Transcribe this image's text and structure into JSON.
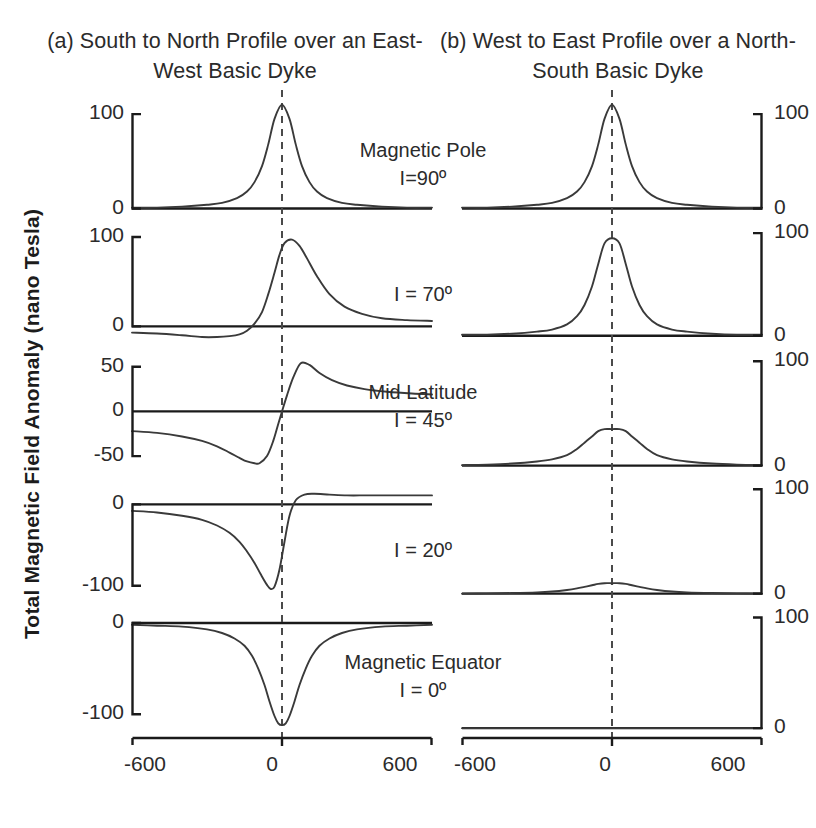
{
  "figure": {
    "ylabel": "Total Magnetic Field Anomaly (nano Tesla)",
    "columns": [
      {
        "id": "a",
        "title": "(a) South to North Profile over an East-West  Basic Dyke"
      },
      {
        "id": "b",
        "title": "(b) West to East Profile over a North-South Basic Dyke"
      }
    ],
    "annotations": [
      {
        "line1": "Magnetic Pole",
        "line2": "I=90º"
      },
      {
        "line1": "",
        "line2": "I = 70º"
      },
      {
        "line1": "Mid Latitude",
        "line2": "I = 45º"
      },
      {
        "line1": "",
        "line2": "I = 20º"
      },
      {
        "line1": "Magnetic Equator",
        "line2": "I = 0º"
      }
    ],
    "xaxis": {
      "ticks": [
        "-600",
        "0",
        "600"
      ],
      "min": -600,
      "max": 600
    },
    "axis_color": "#1a1a1a",
    "curve_color": "#3a3a3a",
    "dash_color": "#4a4a4a"
  },
  "chart_data": {
    "type": "line",
    "xlabel": "",
    "ylabel": "Total Magnetic Field Anomaly (nano Tesla)",
    "xlim": [
      -600,
      600
    ],
    "xticks": [
      -600,
      0,
      600
    ],
    "grid": false,
    "legend": null,
    "panels": [
      {
        "row": 1,
        "inclination_deg": 90,
        "label": "Magnetic Pole I=90º",
        "left": {
          "name": "South to North Profile over an East-West Basic Dyke",
          "yticks": [
            0,
            100
          ],
          "ylim": [
            -10,
            115
          ],
          "peak_value": 110,
          "peak_x": 0,
          "shape": "symmetric-positive-peak",
          "x": [
            -600,
            -500,
            -400,
            -300,
            -240,
            -180,
            -140,
            -110,
            -80,
            -55,
            -30,
            0,
            30,
            55,
            80,
            110,
            140,
            180,
            240,
            300,
            400,
            500,
            600
          ],
          "y": [
            1,
            1,
            2,
            4,
            6,
            11,
            18,
            28,
            45,
            68,
            95,
            110,
            95,
            68,
            45,
            28,
            18,
            11,
            6,
            4,
            2,
            1,
            1
          ]
        },
        "right": {
          "name": "West to East Profile over a North-South Basic Dyke",
          "yticks": [
            0,
            100
          ],
          "ylim": [
            -10,
            115
          ],
          "peak_value": 110,
          "peak_x": 0,
          "shape": "symmetric-positive-peak",
          "x": [
            -600,
            -500,
            -400,
            -300,
            -240,
            -180,
            -140,
            -110,
            -80,
            -55,
            -30,
            0,
            30,
            55,
            80,
            110,
            140,
            180,
            240,
            300,
            400,
            500,
            600
          ],
          "y": [
            1,
            1,
            2,
            4,
            6,
            11,
            18,
            28,
            45,
            68,
            95,
            110,
            95,
            68,
            45,
            28,
            18,
            11,
            6,
            4,
            2,
            1,
            1
          ]
        }
      },
      {
        "row": 2,
        "inclination_deg": 70,
        "label": "I = 70º",
        "left": {
          "yticks": [
            0,
            100
          ],
          "ylim": [
            -22,
            110
          ],
          "peak_value": 97,
          "peak_x": 40,
          "trough_value": -12,
          "trough_x": -180,
          "shape": "skewed-positive-peak-with-small-left-trough",
          "x": [
            -600,
            -500,
            -400,
            -320,
            -260,
            -210,
            -170,
            -140,
            -110,
            -80,
            -55,
            -30,
            -10,
            10,
            40,
            70,
            100,
            140,
            190,
            250,
            320,
            400,
            500,
            600
          ],
          "y": [
            -7,
            -8,
            -10,
            -12,
            -12,
            -11,
            -9,
            -5,
            3,
            16,
            36,
            60,
            80,
            93,
            97,
            90,
            76,
            56,
            36,
            22,
            14,
            9,
            7,
            6
          ]
        },
        "right": {
          "yticks": [
            0,
            100
          ],
          "ylim": [
            -10,
            105
          ],
          "peak_value": 95,
          "peak_x": 0,
          "shape": "symmetric-positive-peak",
          "x": [
            -600,
            -500,
            -400,
            -300,
            -240,
            -180,
            -140,
            -110,
            -80,
            -55,
            -30,
            0,
            30,
            55,
            80,
            110,
            140,
            180,
            240,
            300,
            400,
            500,
            600
          ],
          "y": [
            1,
            1,
            2,
            4,
            6,
            11,
            19,
            30,
            48,
            70,
            90,
            95,
            90,
            70,
            48,
            30,
            19,
            11,
            6,
            4,
            2,
            1,
            1
          ]
        }
      },
      {
        "row": 3,
        "inclination_deg": 45,
        "label": "Mid Latitude I = 45º",
        "left": {
          "yticks": [
            -50,
            0,
            50
          ],
          "ylim": [
            -70,
            62
          ],
          "peak_value": 54,
          "peak_x": 75,
          "trough_value": -58,
          "trough_x": -90,
          "shape": "antisymmetric-dipole",
          "x": [
            -600,
            -500,
            -400,
            -320,
            -260,
            -210,
            -170,
            -140,
            -110,
            -90,
            -60,
            -35,
            -15,
            0,
            20,
            45,
            75,
            110,
            150,
            200,
            260,
            330,
            420,
            520,
            600
          ],
          "y": [
            -22,
            -24,
            -28,
            -33,
            -39,
            -46,
            -52,
            -56,
            -58,
            -58,
            -50,
            -33,
            -14,
            0,
            18,
            38,
            54,
            52,
            43,
            35,
            29,
            25,
            22,
            20,
            19
          ]
        },
        "right": {
          "yticks": [
            0,
            100
          ],
          "ylim": [
            -8,
            105
          ],
          "peak_value": 35,
          "peak_x": 0,
          "shape": "symmetric-positive-peak",
          "x": [
            -600,
            -500,
            -400,
            -300,
            -240,
            -180,
            -140,
            -110,
            -80,
            -55,
            -30,
            0,
            30,
            55,
            80,
            110,
            140,
            180,
            240,
            300,
            400,
            500,
            600
          ],
          "y": [
            0.5,
            1,
            2,
            4,
            6,
            10,
            16,
            22,
            28,
            33,
            35,
            35,
            35,
            33,
            28,
            22,
            16,
            10,
            6,
            4,
            2,
            1,
            0.5
          ]
        }
      },
      {
        "row": 4,
        "inclination_deg": 20,
        "label": "I = 20º",
        "left": {
          "yticks": [
            -100,
            0
          ],
          "ylim": [
            -120,
            25
          ],
          "peak_value": 13,
          "peak_x": 120,
          "trough_value": -104,
          "trough_x": -45,
          "shape": "negative-trough-with-small-right-lobe",
          "x": [
            -600,
            -500,
            -400,
            -320,
            -260,
            -210,
            -170,
            -140,
            -110,
            -85,
            -60,
            -45,
            -30,
            -10,
            10,
            30,
            55,
            90,
            130,
            190,
            260,
            340,
            440,
            540,
            600
          ],
          "y": [
            -8,
            -10,
            -14,
            -19,
            -26,
            -35,
            -46,
            -58,
            -72,
            -86,
            -99,
            -104,
            -101,
            -80,
            -46,
            -14,
            5,
            12,
            13,
            12,
            11,
            11,
            11,
            11,
            11
          ]
        },
        "right": {
          "yticks": [
            0,
            100
          ],
          "ylim": [
            -8,
            105
          ],
          "peak_value": 10,
          "peak_x": 0,
          "shape": "symmetric-low-positive-peak",
          "x": [
            -600,
            -500,
            -400,
            -300,
            -240,
            -180,
            -140,
            -110,
            -80,
            -55,
            -30,
            0,
            30,
            55,
            80,
            110,
            140,
            180,
            240,
            300,
            400,
            500,
            600
          ],
          "y": [
            0,
            0.3,
            0.6,
            1.2,
            2,
            3.5,
            5,
            6.5,
            8,
            9.3,
            10,
            10,
            10,
            9.3,
            8,
            6.5,
            5,
            3.5,
            2,
            1.2,
            0.6,
            0.3,
            0
          ]
        }
      },
      {
        "row": 5,
        "inclination_deg": 0,
        "label": "Magnetic Equator I = 0º",
        "left": {
          "yticks": [
            -100,
            0
          ],
          "ylim": [
            -125,
            12
          ],
          "trough_value": -112,
          "trough_x": 0,
          "shape": "symmetric-negative-trough",
          "x": [
            -600,
            -500,
            -400,
            -300,
            -240,
            -190,
            -150,
            -120,
            -95,
            -70,
            -50,
            -30,
            -15,
            0,
            15,
            30,
            50,
            70,
            95,
            120,
            150,
            190,
            240,
            300,
            400,
            500,
            600
          ],
          "y": [
            -2,
            -3,
            -4,
            -7,
            -11,
            -17,
            -25,
            -36,
            -50,
            -68,
            -86,
            -102,
            -110,
            -112,
            -110,
            -102,
            -86,
            -68,
            -50,
            -36,
            -25,
            -17,
            -11,
            -7,
            -4,
            -3,
            -2
          ]
        },
        "right": {
          "yticks": [
            0,
            100
          ],
          "ylim": [
            -8,
            105
          ],
          "peak_value": 0,
          "shape": "flat-zero-line",
          "x": [
            -600,
            -400,
            -200,
            0,
            200,
            400,
            600
          ],
          "y": [
            0,
            0,
            0,
            0,
            0,
            0,
            0
          ]
        }
      }
    ]
  }
}
